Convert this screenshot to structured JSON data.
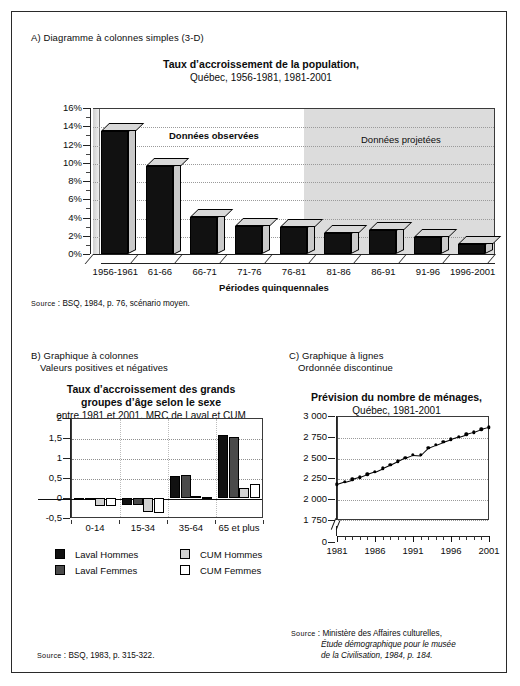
{
  "figure": {
    "sectionA": {
      "label": "A) Diagramme à colonnes simples (3-D)",
      "title": "Taux d’accroissement de la population,",
      "subtitle": "Québec, 1956-1981, 1981-2001",
      "axis_title": "Périodes quinquennales",
      "band_observed": "Données observées",
      "band_projected": "Données projetées",
      "source_kw": "Source",
      "source_text": " : BSQ, 1984, p. 76, scénario moyen."
    },
    "sectionB": {
      "label_line1": "B) Graphique à colonnes",
      "label_line2": "Valeurs positives et négatives",
      "title_line1": "Taux d’accroissement des grands",
      "title_line2": "groupes d’âge selon le sexe",
      "subtitle": "entre 1981 et 2001, MRC de Laval et CUM",
      "source_kw": "Source",
      "source_text": " : BSQ, 1983, p. 315-322."
    },
    "sectionC": {
      "label_line1": "C) Graphique à lignes",
      "label_line2": "Ordonnée discontinue",
      "title": "Prévision du nombre de ménages,",
      "subtitle": "Québec, 1981-2001",
      "source_kw": "Source",
      "source_line1": " : Ministère des Affaires culturelles,",
      "source_line2": "Étude démographique pour le musée",
      "source_line3": "de la Civilisation, 1984, p. 184."
    }
  },
  "chart_data": [
    {
      "id": "A",
      "type": "bar",
      "title": "Taux d’accroissement de la population,",
      "subtitle": "Québec, 1956-1981, 1981-2001",
      "xlabel": "Périodes quinquennales",
      "ylabel": "",
      "ylim": [
        0,
        16
      ],
      "ytick_labels": [
        "0%",
        "2%",
        "4%",
        "6%",
        "8%",
        "10%",
        "12%",
        "14%",
        "16%"
      ],
      "ytick_values": [
        0,
        2,
        4,
        6,
        8,
        10,
        12,
        14,
        16
      ],
      "grid": true,
      "legend": "none",
      "categories": [
        "1956-1961",
        "61-66",
        "66-71",
        "71-76",
        "76-81",
        "81-86",
        "86-91",
        "91-96",
        "1996-2001"
      ],
      "values": [
        13.5,
        9.7,
        4.1,
        3.1,
        3.0,
        2.3,
        2.6,
        1.9,
        1.1
      ],
      "annotations": [
        {
          "text": "Données observées",
          "region": "observed",
          "span": [
            "1956-1961",
            "76-81"
          ]
        },
        {
          "text": "Données projetées",
          "region": "projected",
          "span": [
            "81-86",
            "1996-2001"
          ]
        }
      ]
    },
    {
      "id": "B",
      "type": "bar",
      "title": "Taux d’accroissement des grands groupes d’âge selon le sexe",
      "subtitle": "entre 1981 et 2001, MRC de Laval et CUM",
      "xlabel": "",
      "ylabel": "",
      "ylim": [
        -0.5,
        2
      ],
      "ytick_labels": [
        "-0,5",
        "0",
        "0,5",
        "1",
        "1,5",
        "2"
      ],
      "ytick_values": [
        -0.5,
        0,
        0.5,
        1,
        1.5,
        2
      ],
      "grid": true,
      "legend": "bottom",
      "categories": [
        "0-14",
        "15-34",
        "35-64",
        "65 et plus"
      ],
      "series": [
        {
          "name": "Laval Hommes",
          "color": "#111111",
          "values": [
            -0.02,
            -0.17,
            0.55,
            1.57
          ]
        },
        {
          "name": "Laval Femmes",
          "color": "#4a4a4a",
          "values": [
            -0.02,
            -0.17,
            0.57,
            1.52
          ]
        },
        {
          "name": "CUM Hommes",
          "color": "#d2d2d2",
          "values": [
            -0.19,
            -0.36,
            0.05,
            0.25
          ]
        },
        {
          "name": "CUM Femmes",
          "color": "#ffffff",
          "values": [
            -0.19,
            -0.38,
            0.03,
            0.34
          ]
        }
      ]
    },
    {
      "id": "C",
      "type": "line",
      "title": "Prévision du nombre de ménages,",
      "subtitle": "Québec, 1981-2001",
      "xlabel": "",
      "ylabel": "",
      "ylim": [
        1750,
        3000
      ],
      "axis_break": true,
      "ytick_labels": [
        "0",
        "1 750",
        "2 000",
        "2 250",
        "2 500",
        "2 750",
        "3 000"
      ],
      "ytick_values": [
        0,
        1750,
        2000,
        2250,
        2500,
        2750,
        3000
      ],
      "xtick_labels": [
        "1981",
        "1986",
        "1991",
        "1996",
        "2001"
      ],
      "grid": true,
      "legend": "none",
      "x": [
        1981,
        1982,
        1983,
        1984,
        1985,
        1986,
        1987,
        1988,
        1989,
        1990,
        1991,
        1992,
        1993,
        1994,
        1995,
        1996,
        1997,
        1998,
        1999,
        2000,
        2001
      ],
      "values": [
        2180,
        2210,
        2238,
        2265,
        2300,
        2330,
        2370,
        2410,
        2455,
        2500,
        2535,
        2530,
        2620,
        2655,
        2690,
        2720,
        2750,
        2780,
        2805,
        2840,
        2865
      ]
    }
  ]
}
